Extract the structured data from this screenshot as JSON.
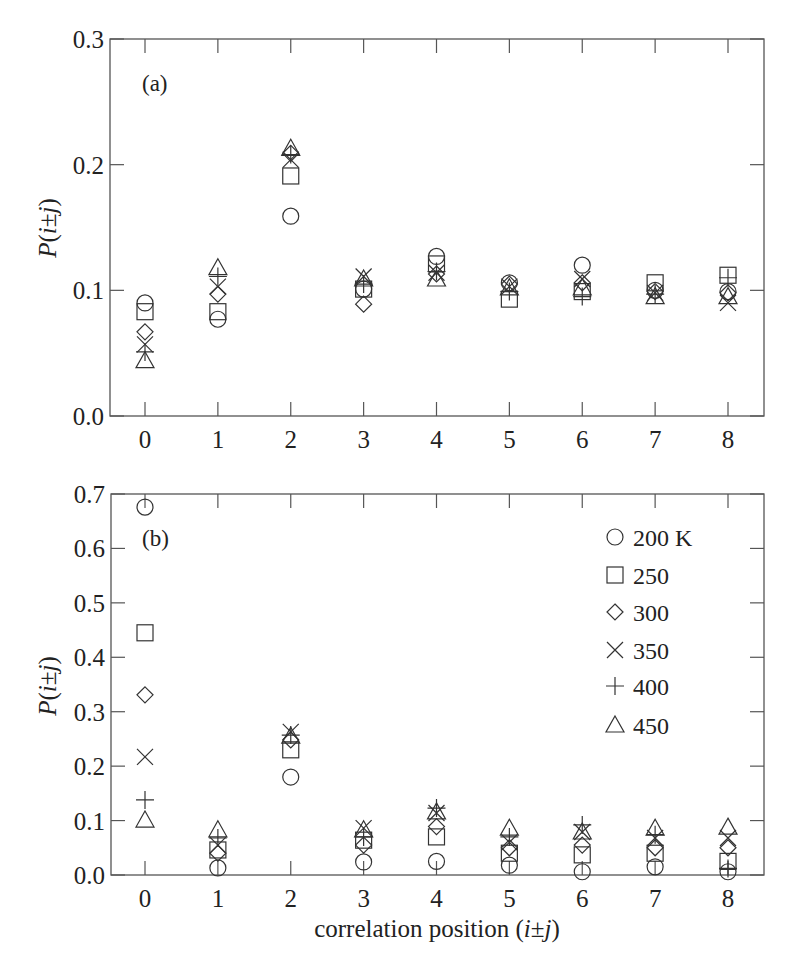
{
  "chart_data": [
    {
      "type": "scatter",
      "panel": "(a)",
      "title": "",
      "xlabel": "",
      "ylabel": "P(i±j)",
      "x": [
        0,
        1,
        2,
        3,
        4,
        5,
        6,
        7,
        8
      ],
      "xticks": [
        "0",
        "1",
        "2",
        "3",
        "4",
        "5",
        "6",
        "7",
        "8"
      ],
      "yticks": [
        "0.0",
        "0.1",
        "0.2",
        "0.3"
      ],
      "xlim": [
        -0.5,
        8.5
      ],
      "ylim": [
        0.0,
        0.3
      ],
      "grid": false,
      "legend": false,
      "series": [
        {
          "name": "200 K",
          "marker": "circle",
          "values": [
            0.09,
            0.077,
            0.159,
            0.101,
            0.127,
            0.106,
            0.12,
            0.1,
            0.099
          ]
        },
        {
          "name": "250",
          "marker": "square",
          "values": [
            0.083,
            0.083,
            0.191,
            0.101,
            0.121,
            0.093,
            0.099,
            0.106,
            0.112
          ]
        },
        {
          "name": "300",
          "marker": "diamond",
          "values": [
            0.067,
            0.097,
            0.209,
            0.089,
            0.113,
            0.105,
            0.106,
            0.099,
            0.098
          ]
        },
        {
          "name": "350",
          "marker": "x",
          "values": [
            0.057,
            0.103,
            0.204,
            0.111,
            0.114,
            0.103,
            0.109,
            0.098,
            0.09
          ]
        },
        {
          "name": "400",
          "marker": "plus",
          "values": [
            0.051,
            0.111,
            0.208,
            0.105,
            0.115,
            0.099,
            0.095,
            0.097,
            0.11
          ]
        },
        {
          "name": "450",
          "marker": "triangle",
          "values": [
            0.044,
            0.118,
            0.213,
            0.109,
            0.109,
            0.102,
            0.102,
            0.095,
            0.095
          ]
        }
      ]
    },
    {
      "type": "scatter",
      "panel": "(b)",
      "title": "",
      "xlabel": "correlation position (i±j)",
      "ylabel": "P(i±j)",
      "x": [
        0,
        1,
        2,
        3,
        4,
        5,
        6,
        7,
        8
      ],
      "xticks": [
        "0",
        "1",
        "2",
        "3",
        "4",
        "5",
        "6",
        "7",
        "8"
      ],
      "yticks": [
        "0.0",
        "0.1",
        "0.2",
        "0.3",
        "0.4",
        "0.5",
        "0.6",
        "0.7"
      ],
      "xlim": [
        -0.5,
        8.5
      ],
      "ylim": [
        0.0,
        0.7
      ],
      "grid": false,
      "legend": true,
      "legend_position": "upper right",
      "series": [
        {
          "name": "200 K",
          "marker": "circle",
          "values": [
            0.676,
            0.013,
            0.18,
            0.024,
            0.025,
            0.018,
            0.006,
            0.015,
            0.006
          ]
        },
        {
          "name": "250",
          "marker": "square",
          "values": [
            0.445,
            0.046,
            0.23,
            0.064,
            0.07,
            0.04,
            0.037,
            0.04,
            0.025
          ]
        },
        {
          "name": "300",
          "marker": "diamond",
          "values": [
            0.331,
            0.04,
            0.248,
            0.055,
            0.089,
            0.05,
            0.055,
            0.05,
            0.05
          ]
        },
        {
          "name": "350",
          "marker": "x",
          "values": [
            0.217,
            0.055,
            0.263,
            0.086,
            0.114,
            0.06,
            0.079,
            0.068,
            0.068
          ]
        },
        {
          "name": "400",
          "marker": "plus",
          "values": [
            0.138,
            0.068,
            0.257,
            0.07,
            0.123,
            0.07,
            0.092,
            0.074,
            0.012
          ]
        },
        {
          "name": "450",
          "marker": "triangle",
          "values": [
            0.101,
            0.083,
            0.255,
            0.083,
            0.116,
            0.086,
            0.079,
            0.086,
            0.088
          ]
        }
      ]
    }
  ],
  "labels": {
    "panel_a": "(a)",
    "panel_b": "(b)",
    "ylabel_prefix": "P(",
    "ylabel_i": "i",
    "ylabel_pm": "±",
    "ylabel_j": "j",
    "ylabel_suffix": ")",
    "xlabel_text": "correlation position (",
    "xlabel_i": "i",
    "xlabel_pm": "±",
    "xlabel_j": "j",
    "xlabel_close": ")"
  },
  "legend": [
    {
      "marker": "circle",
      "label": "200  K"
    },
    {
      "marker": "square",
      "label": "250"
    },
    {
      "marker": "diamond",
      "label": "300"
    },
    {
      "marker": "x",
      "label": "350"
    },
    {
      "marker": "plus",
      "label": "400"
    },
    {
      "marker": "triangle",
      "label": "450"
    }
  ],
  "colors": {
    "axis": "#555555",
    "marker": "#333333",
    "text": "#222222",
    "background": "#ffffff"
  }
}
